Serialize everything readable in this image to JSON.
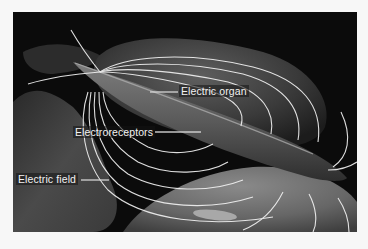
{
  "figure": {
    "colors": {
      "background": "#0b0b0b",
      "page": "#f7f7f7",
      "field_lines": "#f0f0f0",
      "label_text": "#f2f2f2"
    },
    "labels": [
      {
        "id": "electric-organ",
        "text": "Electric organ"
      },
      {
        "id": "electroreceptors",
        "text": "Electroreceptors"
      },
      {
        "id": "electric-field",
        "text": "Electric field"
      }
    ]
  }
}
